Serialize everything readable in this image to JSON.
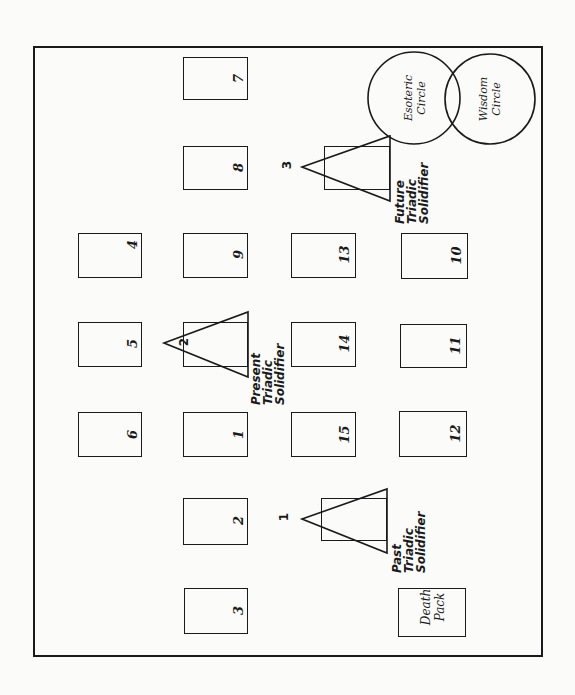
{
  "diagram": {
    "title": "",
    "cards": [
      {
        "id": "7",
        "label": "7"
      },
      {
        "id": "8",
        "label": "8"
      },
      {
        "id": "4",
        "label": "4"
      },
      {
        "id": "9",
        "label": "9"
      },
      {
        "id": "13",
        "label": "13"
      },
      {
        "id": "10",
        "label": "10"
      },
      {
        "id": "5",
        "label": "5"
      },
      {
        "id": "14",
        "label": "14"
      },
      {
        "id": "11",
        "label": "11"
      },
      {
        "id": "6",
        "label": "6"
      },
      {
        "id": "1",
        "label": "1"
      },
      {
        "id": "15",
        "label": "15"
      },
      {
        "id": "12",
        "label": "12"
      },
      {
        "id": "2",
        "label": "2"
      },
      {
        "id": "3",
        "label": "3"
      }
    ],
    "solidifiers": [
      {
        "number": "1",
        "label": "Past\nTriadic\nSolidifier"
      },
      {
        "number": "2",
        "label": "Present\nTriadic\nSolidifier"
      },
      {
        "number": "3",
        "label": "Future\nTriadic\nSolidifier"
      }
    ],
    "circles": [
      {
        "label": "Esoteric\nCircle"
      },
      {
        "label": "Wisdom\nCircle"
      }
    ],
    "death_pack": {
      "label": "Death\nPack"
    },
    "colors": {
      "ink": "#1a1a1a",
      "paper": "#fbfbf9"
    }
  }
}
